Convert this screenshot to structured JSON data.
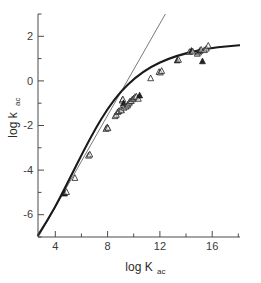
{
  "figure": {
    "background_color": "#ffffff",
    "width": 261,
    "height": 283
  },
  "chart_data": {
    "type": "scatter",
    "title": "",
    "subtitle": "",
    "xlabel": "log K",
    "xlabel_subscript": "ac",
    "ylabel": "log k",
    "ylabel_subscript": "ac",
    "xlim": [
      2.6,
      18.2
    ],
    "ylim": [
      -6.9,
      3.1
    ],
    "xticks": [
      4,
      8,
      12,
      16
    ],
    "xtick_labels": [
      "4",
      "8",
      "12",
      "16"
    ],
    "xticks_minor": [
      2,
      6,
      10,
      14,
      18
    ],
    "yticks": [
      2,
      0,
      -2,
      -4,
      -6
    ],
    "ytick_labels": [
      "2",
      "0",
      "-2",
      "-4",
      "-6"
    ],
    "yticks_minor": [
      3,
      1,
      -1,
      -3,
      -5
    ],
    "grid": false,
    "legend": false,
    "legend_position": "none",
    "axis_style": "left-and-bottom-spines",
    "marker_shape": "triangle-up",
    "marker_colors": {
      "open": "#ffffff",
      "open_edge": "#2a2a2a",
      "filled": "#232323"
    },
    "series": [
      {
        "name": "data points",
        "marker": "triangle-up",
        "points": [
          {
            "x": 4.65,
            "y": -4.95,
            "fill": "filled"
          },
          {
            "x": 4.8,
            "y": -4.88,
            "fill": "open"
          },
          {
            "x": 5.45,
            "y": -4.25,
            "fill": "open"
          },
          {
            "x": 6.5,
            "y": -3.25,
            "fill": "open"
          },
          {
            "x": 6.6,
            "y": -3.2,
            "fill": "open"
          },
          {
            "x": 7.85,
            "y": -2.05,
            "fill": "open"
          },
          {
            "x": 7.95,
            "y": -1.98,
            "fill": "open"
          },
          {
            "x": 8.0,
            "y": -2.02,
            "fill": "open"
          },
          {
            "x": 8.55,
            "y": -1.48,
            "fill": "open"
          },
          {
            "x": 8.65,
            "y": -1.42,
            "fill": "open"
          },
          {
            "x": 8.75,
            "y": -1.3,
            "fill": "open"
          },
          {
            "x": 8.85,
            "y": -1.25,
            "fill": "open"
          },
          {
            "x": 9.0,
            "y": -1.18,
            "fill": "open"
          },
          {
            "x": 9.05,
            "y": -1.22,
            "fill": "open"
          },
          {
            "x": 9.1,
            "y": -0.78,
            "fill": "open"
          },
          {
            "x": 9.15,
            "y": -0.72,
            "fill": "open"
          },
          {
            "x": 9.2,
            "y": -0.9,
            "fill": "filled"
          },
          {
            "x": 9.25,
            "y": -1.1,
            "fill": "open"
          },
          {
            "x": 9.4,
            "y": -1.05,
            "fill": "open"
          },
          {
            "x": 9.5,
            "y": -1.0,
            "fill": "open"
          },
          {
            "x": 9.55,
            "y": -0.95,
            "fill": "open"
          },
          {
            "x": 9.65,
            "y": -0.88,
            "fill": "open"
          },
          {
            "x": 9.7,
            "y": -0.82,
            "fill": "open"
          },
          {
            "x": 9.8,
            "y": -0.8,
            "fill": "open"
          },
          {
            "x": 9.9,
            "y": -0.72,
            "fill": "open"
          },
          {
            "x": 10.0,
            "y": -0.68,
            "fill": "open"
          },
          {
            "x": 10.1,
            "y": -0.62,
            "fill": "open"
          },
          {
            "x": 10.2,
            "y": -0.6,
            "fill": "open"
          },
          {
            "x": 10.35,
            "y": -0.7,
            "fill": "open"
          },
          {
            "x": 10.45,
            "y": -0.55,
            "fill": "filled"
          },
          {
            "x": 11.3,
            "y": 0.22,
            "fill": "open"
          },
          {
            "x": 11.95,
            "y": 0.5,
            "fill": "open"
          },
          {
            "x": 12.05,
            "y": 0.48,
            "fill": "open"
          },
          {
            "x": 12.15,
            "y": 0.55,
            "fill": "open"
          },
          {
            "x": 13.35,
            "y": 1.02,
            "fill": "filled"
          },
          {
            "x": 13.45,
            "y": 1.05,
            "fill": "open"
          },
          {
            "x": 14.3,
            "y": 1.4,
            "fill": "open"
          },
          {
            "x": 14.45,
            "y": 1.45,
            "fill": "filled"
          },
          {
            "x": 14.55,
            "y": 1.42,
            "fill": "open"
          },
          {
            "x": 14.9,
            "y": 1.32,
            "fill": "open"
          },
          {
            "x": 15.0,
            "y": 1.38,
            "fill": "open"
          },
          {
            "x": 15.1,
            "y": 1.45,
            "fill": "filled"
          },
          {
            "x": 15.2,
            "y": 1.5,
            "fill": "open"
          },
          {
            "x": 15.3,
            "y": 0.98,
            "fill": "filled"
          },
          {
            "x": 15.45,
            "y": 1.48,
            "fill": "open"
          },
          {
            "x": 15.6,
            "y": 1.55,
            "fill": "open"
          },
          {
            "x": 15.75,
            "y": 1.68,
            "fill": "open"
          }
        ]
      }
    ],
    "fits": [
      {
        "name": "curved-fit",
        "style": "thick-solid",
        "color": "#1a1a1a",
        "description": "saturating curve flattening at high log K",
        "points": [
          {
            "x": 2.75,
            "y": -6.3
          },
          {
            "x": 3.5,
            "y": -5.72
          },
          {
            "x": 4.5,
            "y": -4.95
          },
          {
            "x": 5.5,
            "y": -4.18
          },
          {
            "x": 6.5,
            "y": -3.32
          },
          {
            "x": 7.5,
            "y": -2.45
          },
          {
            "x": 8.5,
            "y": -1.55
          },
          {
            "x": 9.5,
            "y": -0.8
          },
          {
            "x": 10.5,
            "y": -0.15
          },
          {
            "x": 11.5,
            "y": 0.35
          },
          {
            "x": 12.5,
            "y": 0.75
          },
          {
            "x": 13.5,
            "y": 1.05
          },
          {
            "x": 14.5,
            "y": 1.28
          },
          {
            "x": 15.5,
            "y": 1.45
          },
          {
            "x": 16.5,
            "y": 1.58
          },
          {
            "x": 17.5,
            "y": 1.66
          },
          {
            "x": 18.1,
            "y": 1.7
          }
        ]
      },
      {
        "name": "straight-line-fit",
        "style": "thin-solid",
        "color": "#6b6b6b",
        "description": "linear slope-1 reference line exiting top of axes",
        "points": [
          {
            "x": 2.75,
            "y": -6.4
          },
          {
            "x": 12.6,
            "y": 3.05
          }
        ]
      }
    ]
  }
}
